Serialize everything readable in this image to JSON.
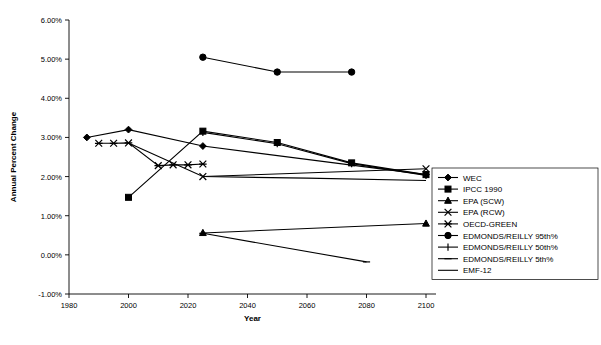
{
  "chart_data": {
    "type": "line",
    "title": "",
    "xlabel": "Year",
    "ylabel": "Annual Percent Change",
    "xlim": [
      1980,
      2100
    ],
    "ylim": [
      -1.0,
      6.0
    ],
    "xticks": [
      1980,
      2000,
      2020,
      2040,
      2060,
      2080,
      2100
    ],
    "xtick_labels": [
      "1980",
      "2000",
      "2020",
      "2040",
      "2060",
      "2080",
      "2100"
    ],
    "yticks": [
      -1.0,
      0.0,
      1.0,
      2.0,
      3.0,
      4.0,
      5.0,
      6.0
    ],
    "ytick_labels": [
      "-1.00%",
      "0.00%",
      "1.00%",
      "2.00%",
      "3.00%",
      "4.00%",
      "5.00%",
      "6.00%"
    ],
    "grid": false,
    "legend_position": "right",
    "y_unit": "percent",
    "series": [
      {
        "name": "WEC",
        "marker": "diamond",
        "x": [
          1986,
          2000,
          2025,
          2100
        ],
        "values": [
          3.0,
          3.2,
          2.78,
          2.05
        ]
      },
      {
        "name": "IPCC 1990",
        "marker": "square",
        "x": [
          2000,
          2025,
          2050,
          2075,
          2100
        ],
        "values": [
          1.47,
          3.16,
          2.87,
          2.35,
          2.05
        ]
      },
      {
        "name": "EPA (SCW)",
        "marker": "triangle",
        "x": [
          2025,
          2100
        ],
        "values": [
          0.56,
          0.8
        ]
      },
      {
        "name": "EPA (RCW)",
        "marker": "x",
        "x": [
          2025,
          2100
        ],
        "values": [
          2.0,
          2.2
        ]
      },
      {
        "name": "OECD-GREEN",
        "marker": "asterisk",
        "x": [
          1990,
          1995,
          2000,
          2010,
          2015,
          2020,
          2025
        ],
        "values": [
          2.85,
          2.85,
          2.86,
          2.28,
          2.3,
          2.3,
          2.32
        ]
      },
      {
        "name": "EDMONDS/REILLY 95th%",
        "marker": "circle",
        "x": [
          2025,
          2050,
          2075
        ],
        "values": [
          5.05,
          4.67,
          4.67
        ]
      },
      {
        "name": "EDMONDS/REILLY 50th%",
        "marker": "plus",
        "x": [
          2025,
          2050,
          2075,
          2100
        ],
        "values": [
          3.13,
          2.84,
          2.33,
          2.03
        ]
      },
      {
        "name": "EDMONDS/REILLY 5th%",
        "marker": "dash",
        "x": [
          2025,
          2080
        ],
        "values": [
          0.55,
          -0.18
        ]
      },
      {
        "name": "EMF-12",
        "marker": "line",
        "x": [
          2000,
          2025,
          2060,
          2100
        ],
        "values": [
          2.86,
          2.0,
          1.96,
          1.9
        ]
      }
    ]
  },
  "colors": {
    "line": "#000000",
    "background": "#ffffff",
    "axis": "#000000"
  }
}
